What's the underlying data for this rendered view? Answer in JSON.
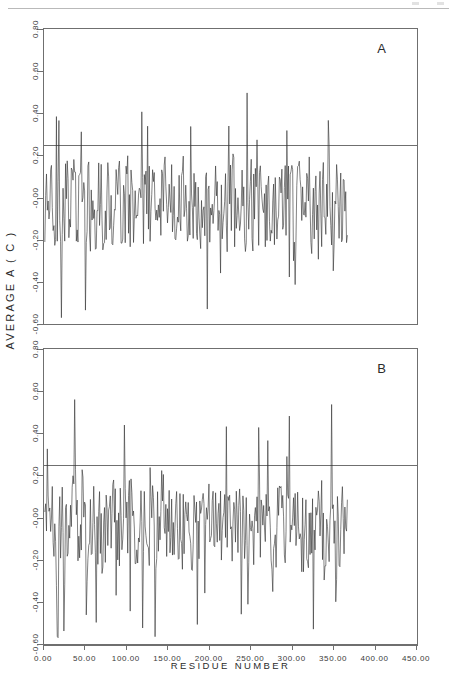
{
  "figure": {
    "yaxis_title": "AVERAGE A ( C )",
    "xaxis_title": "RESIDUE NUMBER"
  },
  "panels": [
    {
      "letter": "A"
    },
    {
      "letter": "B"
    }
  ],
  "chart_data": {
    "type": "line",
    "title": "",
    "subtitle": "",
    "xlabel": "RESIDUE NUMBER",
    "ylabel": "AVERAGE A ( C )",
    "xlim": [
      0,
      450
    ],
    "ylim": [
      -0.6,
      0.8
    ],
    "xticks": [
      0,
      50,
      100,
      150,
      200,
      250,
      300,
      350,
      400,
      450
    ],
    "xticklabels": [
      "0.00",
      "50.00",
      "100.00",
      "150.00",
      "200.00",
      "250.00",
      "300.00",
      "350.00",
      "400.00",
      "450.00"
    ],
    "yticks": [
      0.8,
      0.6,
      0.4,
      0.2,
      -0.0,
      -0.2,
      -0.4,
      -0.6
    ],
    "yticklabels": [
      "0.80",
      "0.60",
      "0.40",
      "0.20",
      "-0.00",
      "-0.20",
      "-0.40",
      "-0.60"
    ],
    "grid": false,
    "legend": null,
    "annotations": [
      {
        "text": "A",
        "panel": 0,
        "position": "top-right"
      },
      {
        "text": "B",
        "panel": 1,
        "position": "top-right"
      }
    ],
    "series": [
      {
        "name": "A",
        "panel": 0,
        "threshold": 0.25,
        "x_range": [
          1,
          366
        ],
        "seed": 1307,
        "noise_scale": 0.21,
        "baseline": -0.035,
        "spike_probability": 0.1,
        "description": "Dense residue-by-residue averaged hydropathy trace, panel A. Values oscillate mostly between -0.45 and +0.35 with occasional sharp positive spikes reaching 0.50-0.55 near residues 150-260 and sharp negative excursions to -0.55 near residues 30-60."
      },
      {
        "name": "B",
        "panel": 1,
        "threshold": 0.25,
        "x_range": [
          1,
          366
        ],
        "seed": 90211,
        "noise_scale": 0.2,
        "baseline": -0.045,
        "spike_probability": 0.1,
        "description": "Dense residue-by-residue averaged hydropathy trace, panel B. Similar oscillation band, positive spikes up to ~0.47 around residues 120-300, deepest negative excursion near -0.55 around residue 150."
      }
    ]
  }
}
